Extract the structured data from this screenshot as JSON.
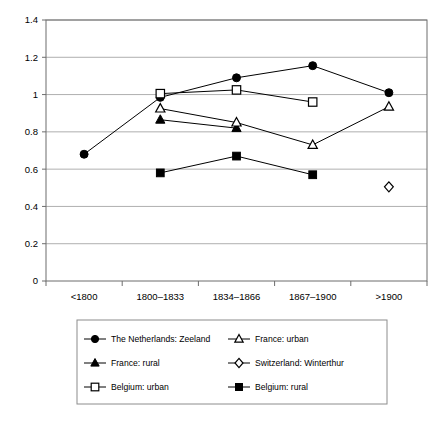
{
  "chart_data": {
    "type": "line",
    "title": "",
    "subtitle": "",
    "xlabel": "",
    "ylabel": "",
    "categories": [
      "<1800",
      "1800–1833",
      "1834–1866",
      "1867–1900",
      ">1900"
    ],
    "ylim": [
      0,
      1.4
    ],
    "yticks": [
      "0",
      "0.2",
      "0.4",
      "0.6",
      "0.8",
      "1",
      "1.2",
      "1.4"
    ],
    "ytick_values": [
      0,
      0.2,
      0.4,
      0.6,
      0.8,
      1,
      1.2,
      1.4
    ],
    "grid": "horizontal",
    "legend_position": "bottom",
    "series": [
      {
        "name": "The Netherlands: Zeeland",
        "marker": "filled-circle",
        "values": [
          0.68,
          0.985,
          1.09,
          1.155,
          1.01
        ]
      },
      {
        "name": "France: rural",
        "marker": "filled-triangle",
        "values": [
          null,
          0.865,
          0.82,
          null,
          null
        ]
      },
      {
        "name": "Belgium: urban",
        "marker": "open-square",
        "values": [
          null,
          1.005,
          1.025,
          0.96,
          null
        ]
      },
      {
        "name": "France: urban",
        "marker": "open-triangle",
        "values": [
          null,
          0.925,
          0.85,
          0.73,
          0.935
        ]
      },
      {
        "name": "Switzerland: Winterthur",
        "marker": "open-diamond",
        "values": [
          null,
          null,
          null,
          null,
          0.505
        ]
      },
      {
        "name": "Belgium: rural",
        "marker": "filled-square",
        "values": [
          null,
          0.58,
          0.67,
          0.57,
          null
        ]
      }
    ]
  },
  "legend": {
    "entries": [
      {
        "label": "The Netherlands: Zeeland",
        "marker": "filled-circle"
      },
      {
        "label": "France: urban",
        "marker": "open-triangle"
      },
      {
        "label": "France: rural",
        "marker": "filled-triangle"
      },
      {
        "label": "Switzerland: Winterthur",
        "marker": "open-diamond"
      },
      {
        "label": "Belgium: urban",
        "marker": "open-square"
      },
      {
        "label": "Belgium: rural",
        "marker": "filled-square"
      }
    ]
  },
  "colors": {
    "ink": "#000000",
    "grid": "#9a9a9a",
    "axis": "#6d6d6d",
    "background": "#ffffff"
  }
}
